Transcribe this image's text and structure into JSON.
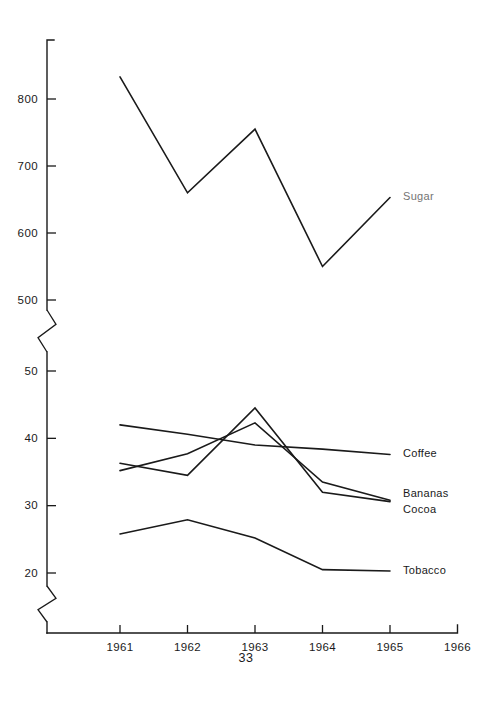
{
  "chart_data": {
    "type": "line",
    "title": "",
    "subtitle": "",
    "xlabel": "",
    "ylabel": "",
    "grid": false,
    "legend_position": "right-inline",
    "x": [
      1961,
      1962,
      1963,
      1964,
      1965
    ],
    "xticks": [
      "1961",
      "1962",
      "1963",
      "1964",
      "1965",
      "1966"
    ],
    "xlim": [
      1960.55,
      1966.0
    ],
    "axis_style": "broken-y-axis",
    "yaxis_upper": {
      "ticks": [
        500,
        600,
        700,
        800
      ],
      "tick_labels": [
        "500",
        "600",
        "700",
        "800"
      ],
      "ylim": [
        500,
        870
      ]
    },
    "yaxis_lower": {
      "ticks": [
        20,
        30,
        40,
        50
      ],
      "tick_labels": [
        "20",
        "30",
        "40",
        "50"
      ],
      "ylim": [
        17,
        54
      ]
    },
    "series": [
      {
        "name": "Sugar",
        "label": "Sugar",
        "scale": "upper",
        "label_faded": true,
        "values": [
          833,
          660,
          755,
          550,
          653
        ]
      },
      {
        "name": "Coffee",
        "label": "Coffee",
        "scale": "lower",
        "label_faded": false,
        "values": [
          42.0,
          40.6,
          39.0,
          38.4,
          37.6
        ]
      },
      {
        "name": "Bananas",
        "label": "Bananas",
        "scale": "lower",
        "label_faded": false,
        "values": [
          35.2,
          37.7,
          42.3,
          33.5,
          30.8
        ]
      },
      {
        "name": "Cocoa",
        "label": "Cocoa",
        "scale": "lower",
        "label_faded": false,
        "values": [
          36.3,
          34.5,
          44.5,
          32.0,
          30.6
        ]
      },
      {
        "name": "Tobacco",
        "label": "Tobacco",
        "scale": "lower",
        "label_faded": false,
        "values": [
          25.8,
          27.9,
          25.2,
          20.5,
          20.3
        ]
      }
    ]
  },
  "footer": {
    "page_number": "33"
  }
}
